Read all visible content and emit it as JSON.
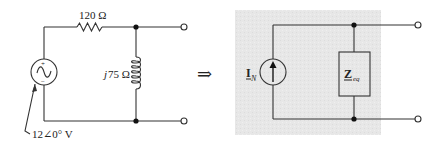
{
  "left_circuit": {
    "resistor_label": "120 Ω",
    "inductor_label_j": "j",
    "inductor_label_value": "75 Ω",
    "source_label": "12∠0° V",
    "source_plus": "+",
    "source_minus": "−"
  },
  "transform_arrow": "⇒",
  "right_circuit": {
    "current_source_label": "I",
    "current_source_subscript": "N",
    "impedance_label": "Z",
    "impedance_subscript": "eq"
  },
  "colors": {
    "wire": "#333333",
    "shaded_box": "#e6e6e6",
    "background": "#ffffff"
  }
}
